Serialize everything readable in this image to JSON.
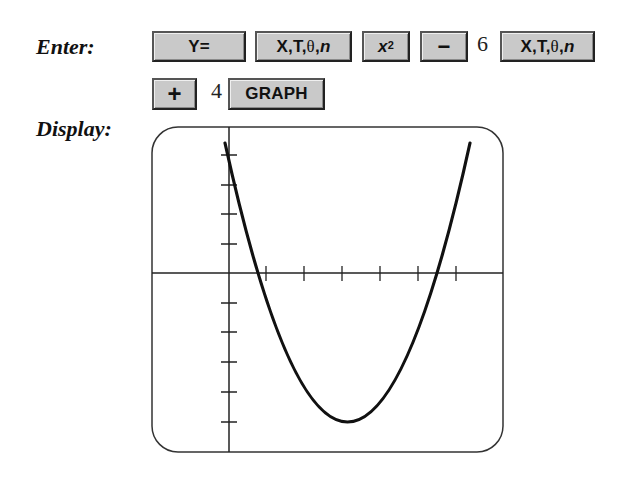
{
  "labels": {
    "enter": "Enter:",
    "display": "Display:"
  },
  "keystrokes": {
    "row1": [
      {
        "type": "key",
        "label": "Y="
      },
      {
        "type": "key",
        "label": "X,T,θ,n"
      },
      {
        "type": "key",
        "label": "x²"
      },
      {
        "type": "key",
        "label": "−"
      },
      {
        "type": "number",
        "label": "6"
      },
      {
        "type": "key",
        "label": "X,T,θ,n"
      }
    ],
    "row2": [
      {
        "type": "key",
        "label": "+"
      },
      {
        "type": "number",
        "label": "4"
      },
      {
        "type": "key",
        "label": "GRAPH"
      }
    ]
  },
  "keys": {
    "y_equals": "Y=",
    "xt_part1": "X,T,",
    "theta": "θ",
    "comma": ",",
    "n": "n",
    "x": "x",
    "sq": "2",
    "minus": "−",
    "six": "6",
    "plus": "+",
    "four": "4",
    "graph": "GRAPH"
  },
  "graph": {
    "function": "y = x^2 - 6x + 4",
    "x_ticks": [
      1,
      2,
      3,
      4,
      5,
      6
    ],
    "y_ticks": [
      -5,
      -4,
      -3,
      -2,
      -1,
      1,
      2,
      3,
      4
    ],
    "vertex": [
      3,
      -5
    ],
    "roots": [
      0.76,
      5.24
    ],
    "colors": {
      "curve": "#111111",
      "axes": "#222222",
      "frame": "#333333"
    }
  }
}
